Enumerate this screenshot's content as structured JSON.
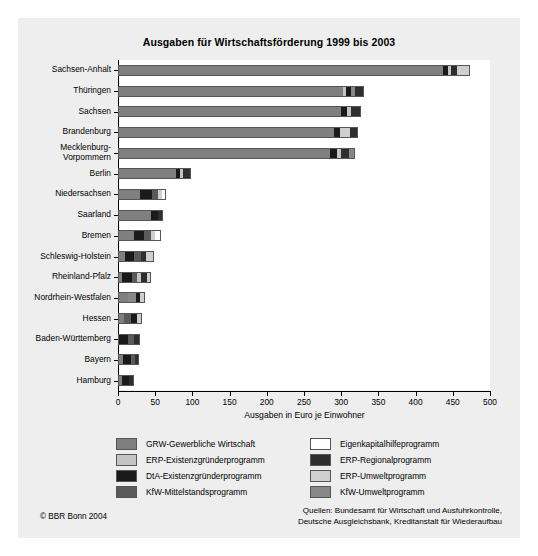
{
  "figure": {
    "title": "Ausgaben für Wirtschaftsförderung 1999 bis 2003",
    "copyright": "© BBR Bonn 2004",
    "sources_line1": "Quellen: Bundesamt für Wirtschaft und Ausfuhrkontrolle,",
    "sources_line2": "Deutsche Ausgleichsbank, Kreditanstalt für Wiederaufbau"
  },
  "colors": {
    "panel_background": "#eeeeee",
    "plot_background": "#ffffff",
    "axis": "#000000",
    "grw_gewerbliche_wirtschaft": "#7f7f7f",
    "erp_existenzgruenderprogramm": "#c4c4c4",
    "dta_existenzgruenderprogramm": "#1a1a1a",
    "kfw_mittelstandsprogramm": "#5a5a5a",
    "eigenkapitalhilfeprogramm": "#ffffff",
    "erp_regionalprogramm": "#2e2e2e",
    "erp_umweltprogramm": "#cfcfcf",
    "kfw_umweltprogramm": "#888888"
  },
  "legend": {
    "columns": [
      {
        "items": [
          {
            "label": "GRW-Gewerbliche Wirtschaft",
            "color": "#7f7f7f",
            "key": "grw"
          },
          {
            "label": "ERP-Existenzgründerprogramm",
            "color": "#c4c4c4",
            "key": "erp_exist"
          },
          {
            "label": "DtA-Existenzgründerprogramm",
            "color": "#1a1a1a",
            "key": "dta"
          },
          {
            "label": "KfW-Mittelstandsprogramm",
            "color": "#5a5a5a",
            "key": "kfw_mittel"
          }
        ]
      },
      {
        "items": [
          {
            "label": "Eigenkapitalhilfeprogramm",
            "color": "#ffffff",
            "key": "ekh"
          },
          {
            "label": "ERP-Regionalprogramm",
            "color": "#2e2e2e",
            "key": "erp_reg"
          },
          {
            "label": "ERP-Umweltprogramm",
            "color": "#cfcfcf",
            "key": "erp_umwelt"
          },
          {
            "label": "KfW-Umweltprogramm",
            "color": "#888888",
            "key": "kfw_umwelt"
          }
        ]
      }
    ]
  },
  "chart_data": {
    "type": "bar",
    "orientation": "horizontal",
    "stacked": true,
    "title": "Ausgaben für Wirtschaftsförderung 1999 bis 2003",
    "xlabel": "Ausgaben in Euro je Einwohner",
    "ylabel": "",
    "xlim": [
      0,
      500
    ],
    "xticks": [
      0,
      50,
      100,
      150,
      200,
      250,
      300,
      350,
      400,
      450,
      500
    ],
    "grid": false,
    "legend_position": "below",
    "series_order": [
      "grw",
      "erp_exist",
      "dta",
      "kfw_mittel",
      "ekh",
      "erp_reg",
      "erp_umwelt",
      "kfw_umwelt"
    ],
    "series_labels": {
      "grw": "GRW-Gewerbliche Wirtschaft",
      "erp_exist": "ERP-Existenzgründerprogramm",
      "dta": "DtA-Existenzgründerprogramm",
      "kfw_mittel": "KfW-Mittelstandsprogramm",
      "ekh": "Eigenkapitalhilfeprogramm",
      "erp_reg": "ERP-Regionalprogramm",
      "erp_umwelt": "ERP-Umweltprogramm",
      "kfw_umwelt": "KfW-Umweltprogramm"
    },
    "categories": [
      "Sachsen-Anhalt",
      "Thüringen",
      "Sachsen",
      "Brandenburg",
      "Mecklenburg-\nVorpommern",
      "Berlin",
      "Niedersachsen",
      "Saarland",
      "Bremen",
      "Schleswig-Holstein",
      "Rheinland-Pfalz",
      "Nordrhein-Westfalen",
      "Hessen",
      "Baden-Württemberg",
      "Bayern",
      "Hamburg"
    ],
    "totals": [
      473,
      330,
      326,
      322,
      318,
      98,
      64,
      60,
      58,
      48,
      45,
      36,
      32,
      30,
      28,
      22
    ],
    "rows": [
      {
        "category": "Sachsen-Anhalt",
        "total": 473,
        "segments": [
          {
            "key": "grw",
            "value": 437,
            "color": "#7f7f7f"
          },
          {
            "key": "dta",
            "value": 7,
            "color": "#1a1a1a"
          },
          {
            "key": "erp_exist",
            "value": 3,
            "color": "#c4c4c4"
          },
          {
            "key": "erp_reg",
            "value": 9,
            "color": "#2e2e2e"
          },
          {
            "key": "erp_umwelt",
            "value": 17,
            "color": "#cfcfcf"
          }
        ]
      },
      {
        "category": "Thüringen",
        "total": 330,
        "segments": [
          {
            "key": "grw",
            "value": 303,
            "color": "#7f7f7f"
          },
          {
            "key": "erp_exist",
            "value": 3,
            "color": "#c4c4c4"
          },
          {
            "key": "dta",
            "value": 7,
            "color": "#1a1a1a"
          },
          {
            "key": "kfw_umwelt",
            "value": 5,
            "color": "#888888"
          },
          {
            "key": "erp_reg",
            "value": 12,
            "color": "#2e2e2e"
          }
        ]
      },
      {
        "category": "Sachsen",
        "total": 326,
        "segments": [
          {
            "key": "grw",
            "value": 300,
            "color": "#7f7f7f"
          },
          {
            "key": "dta",
            "value": 8,
            "color": "#1a1a1a"
          },
          {
            "key": "erp_exist",
            "value": 5,
            "color": "#c4c4c4"
          },
          {
            "key": "erp_reg",
            "value": 13,
            "color": "#2e2e2e"
          }
        ]
      },
      {
        "category": "Brandenburg",
        "total": 322,
        "segments": [
          {
            "key": "grw",
            "value": 290,
            "color": "#7f7f7f"
          },
          {
            "key": "dta",
            "value": 8,
            "color": "#1a1a1a"
          },
          {
            "key": "erp_umwelt",
            "value": 14,
            "color": "#cfcfcf"
          },
          {
            "key": "erp_reg",
            "value": 10,
            "color": "#2e2e2e"
          }
        ]
      },
      {
        "category": "Mecklenburg-Vorpommern",
        "total": 318,
        "segments": [
          {
            "key": "grw",
            "value": 285,
            "color": "#7f7f7f"
          },
          {
            "key": "dta",
            "value": 9,
            "color": "#1a1a1a"
          },
          {
            "key": "erp_exist",
            "value": 6,
            "color": "#c4c4c4"
          },
          {
            "key": "erp_reg",
            "value": 11,
            "color": "#2e2e2e"
          },
          {
            "key": "kfw_umwelt",
            "value": 7,
            "color": "#888888"
          }
        ]
      },
      {
        "category": "Berlin",
        "total": 98,
        "segments": [
          {
            "key": "grw",
            "value": 78,
            "color": "#7f7f7f"
          },
          {
            "key": "dta",
            "value": 6,
            "color": "#1a1a1a"
          },
          {
            "key": "erp_exist",
            "value": 4,
            "color": "#c4c4c4"
          },
          {
            "key": "erp_reg",
            "value": 10,
            "color": "#2e2e2e"
          }
        ]
      },
      {
        "category": "Niedersachsen",
        "total": 64,
        "segments": [
          {
            "key": "grw",
            "value": 30,
            "color": "#7f7f7f"
          },
          {
            "key": "dta",
            "value": 16,
            "color": "#1a1a1a"
          },
          {
            "key": "kfw_mittel",
            "value": 8,
            "color": "#5a5a5a"
          },
          {
            "key": "erp_umwelt",
            "value": 5,
            "color": "#cfcfcf"
          },
          {
            "key": "ekh",
            "value": 5,
            "color": "#ffffff"
          }
        ]
      },
      {
        "category": "Saarland",
        "total": 60,
        "segments": [
          {
            "key": "grw",
            "value": 44,
            "color": "#7f7f7f"
          },
          {
            "key": "dta",
            "value": 10,
            "color": "#1a1a1a"
          },
          {
            "key": "erp_reg",
            "value": 6,
            "color": "#2e2e2e"
          }
        ]
      },
      {
        "category": "Bremen",
        "total": 58,
        "segments": [
          {
            "key": "grw",
            "value": 22,
            "color": "#7f7f7f"
          },
          {
            "key": "dta",
            "value": 13,
            "color": "#1a1a1a"
          },
          {
            "key": "kfw_mittel",
            "value": 9,
            "color": "#5a5a5a"
          },
          {
            "key": "erp_umwelt",
            "value": 6,
            "color": "#cfcfcf"
          },
          {
            "key": "ekh",
            "value": 8,
            "color": "#ffffff"
          }
        ]
      },
      {
        "category": "Schleswig-Holstein",
        "total": 48,
        "segments": [
          {
            "key": "grw",
            "value": 10,
            "color": "#7f7f7f"
          },
          {
            "key": "dta",
            "value": 12,
            "color": "#1a1a1a"
          },
          {
            "key": "kfw_mittel",
            "value": 9,
            "color": "#5a5a5a"
          },
          {
            "key": "erp_reg",
            "value": 6,
            "color": "#2e2e2e"
          },
          {
            "key": "erp_umwelt",
            "value": 11,
            "color": "#cfcfcf"
          }
        ]
      },
      {
        "category": "Rheinland-Pfalz",
        "total": 45,
        "segments": [
          {
            "key": "grw",
            "value": 6,
            "color": "#7f7f7f"
          },
          {
            "key": "dta",
            "value": 13,
            "color": "#1a1a1a"
          },
          {
            "key": "kfw_mittel",
            "value": 7,
            "color": "#5a5a5a"
          },
          {
            "key": "erp_exist",
            "value": 5,
            "color": "#c4c4c4"
          },
          {
            "key": "erp_reg",
            "value": 8,
            "color": "#2e2e2e"
          },
          {
            "key": "erp_umwelt",
            "value": 6,
            "color": "#cfcfcf"
          }
        ]
      },
      {
        "category": "Nordrhein-Westfalen",
        "total": 36,
        "segments": [
          {
            "key": "grw",
            "value": 14,
            "color": "#7f7f7f"
          },
          {
            "key": "kfw_umwelt",
            "value": 10,
            "color": "#888888"
          },
          {
            "key": "dta",
            "value": 6,
            "color": "#1a1a1a"
          },
          {
            "key": "erp_umwelt",
            "value": 6,
            "color": "#cfcfcf"
          }
        ]
      },
      {
        "category": "Hessen",
        "total": 32,
        "segments": [
          {
            "key": "grw",
            "value": 8,
            "color": "#7f7f7f"
          },
          {
            "key": "kfw_mittel",
            "value": 10,
            "color": "#5a5a5a"
          },
          {
            "key": "dta",
            "value": 8,
            "color": "#1a1a1a"
          },
          {
            "key": "erp_umwelt",
            "value": 6,
            "color": "#cfcfcf"
          }
        ]
      },
      {
        "category": "Baden-Württemberg",
        "total": 30,
        "segments": [
          {
            "key": "dta",
            "value": 13,
            "color": "#1a1a1a"
          },
          {
            "key": "kfw_mittel",
            "value": 9,
            "color": "#5a5a5a"
          },
          {
            "key": "erp_reg",
            "value": 8,
            "color": "#2e2e2e"
          }
        ]
      },
      {
        "category": "Bayern",
        "total": 28,
        "segments": [
          {
            "key": "grw",
            "value": 7,
            "color": "#7f7f7f"
          },
          {
            "key": "dta",
            "value": 10,
            "color": "#1a1a1a"
          },
          {
            "key": "kfw_mittel",
            "value": 6,
            "color": "#5a5a5a"
          },
          {
            "key": "erp_reg",
            "value": 5,
            "color": "#2e2e2e"
          }
        ]
      },
      {
        "category": "Hamburg",
        "total": 22,
        "segments": [
          {
            "key": "grw",
            "value": 6,
            "color": "#7f7f7f"
          },
          {
            "key": "dta",
            "value": 9,
            "color": "#1a1a1a"
          },
          {
            "key": "erp_reg",
            "value": 7,
            "color": "#2e2e2e"
          }
        ]
      }
    ]
  }
}
